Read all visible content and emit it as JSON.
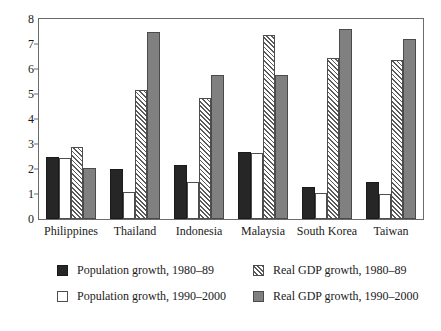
{
  "chart_data": {
    "type": "bar",
    "title": "",
    "subtitle": "",
    "xlabel": "",
    "ylabel": "",
    "ylim": [
      0,
      8
    ],
    "yticks": [
      0,
      1,
      2,
      3,
      4,
      5,
      6,
      7,
      8
    ],
    "ytick_labels": [
      "0",
      "1",
      "2",
      "3",
      "4",
      "5",
      "6",
      "7",
      "8"
    ],
    "grid": false,
    "legend_position": "below",
    "categories": [
      "Philippines",
      "Thailand",
      "Indonesia",
      "Malaysia",
      "South Korea",
      "Taiwan"
    ],
    "series": [
      {
        "name": "Population growth, 1980–89",
        "key": "pop80",
        "style": "solid-black",
        "color": "#262626",
        "values": [
          2.5,
          2.0,
          2.15,
          2.7,
          1.3,
          1.5
        ]
      },
      {
        "name": "Population growth, 1990–2000",
        "key": "pop90",
        "style": "open-white",
        "color": "#ffffff",
        "values": [
          2.45,
          1.1,
          1.5,
          2.65,
          1.05,
          1.0
        ]
      },
      {
        "name": "Real GDP growth, 1980–89",
        "key": "gdp80",
        "style": "diagonal-hatch",
        "color": "#ffffff",
        "values": [
          2.9,
          5.15,
          4.85,
          7.35,
          6.45,
          6.35
        ]
      },
      {
        "name": "Real GDP growth, 1990–2000",
        "key": "gdp90",
        "style": "solid-gray",
        "color": "#808080",
        "values": [
          2.05,
          7.5,
          5.75,
          5.75,
          7.6,
          7.2
        ]
      }
    ]
  },
  "legend": {
    "items": [
      {
        "label": "Population growth, 1980–89",
        "swatch": "pop80"
      },
      {
        "label": "Real GDP growth, 1980–89",
        "swatch": "gdp80"
      },
      {
        "label": "Population growth, 1990–2000",
        "swatch": "pop90"
      },
      {
        "label": "Real GDP growth, 1990–2000",
        "swatch": "gdp90"
      }
    ]
  },
  "colors": {
    "pop80": "#262626",
    "pop90": "#ffffff",
    "gdp80": "#ffffff",
    "gdp90": "#808080",
    "axis": "#6b6b6b",
    "text": "#1a1a1a",
    "background": "#ffffff"
  }
}
